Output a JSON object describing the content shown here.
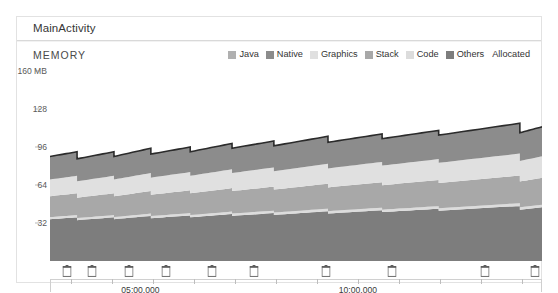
{
  "panel": {
    "header_title": "MainActivity",
    "section_label": "MEMORY"
  },
  "legend": {
    "items": [
      {
        "label": "Java",
        "color": "#b0b0b0",
        "swatch": true
      },
      {
        "label": "Native",
        "color": "#8c8c8c",
        "swatch": true
      },
      {
        "label": "Graphics",
        "color": "#e0e0e0",
        "swatch": true
      },
      {
        "label": "Stack",
        "color": "#a8a8a8",
        "swatch": true
      },
      {
        "label": "Code",
        "color": "#dcdcdc",
        "swatch": true
      },
      {
        "label": "Others",
        "color": "#7d7d7d",
        "swatch": true
      },
      {
        "label": "Allocated",
        "color": "#2b2b2b",
        "swatch": false
      }
    ]
  },
  "chart_data": {
    "type": "area",
    "title": "MEMORY",
    "xlabel": "",
    "ylabel": "MB",
    "ylim": [
      0,
      160
    ],
    "yticks": [
      32,
      64,
      96,
      128,
      160
    ],
    "ytick_labels": [
      "32",
      "64",
      "96",
      "128",
      "160 MB"
    ],
    "grid": false,
    "legend_position": "top-right",
    "x_axis": {
      "tick_count": 12,
      "labeled_ticks": [
        {
          "position": 0.145,
          "label": "05:00.000"
        },
        {
          "position": 0.587,
          "label": "10:00.000"
        }
      ]
    },
    "gc_events": {
      "icon": "trash-can-icon",
      "positions": [
        0.035,
        0.085,
        0.16,
        0.235,
        0.33,
        0.415,
        0.56,
        0.695,
        0.885,
        0.985
      ]
    },
    "series": [
      {
        "name": "Others",
        "color": "#7d7d7d",
        "stack_order": 1
      },
      {
        "name": "Code",
        "color": "#dcdcdc",
        "stack_order": 2
      },
      {
        "name": "Stack",
        "color": "#a8a8a8",
        "stack_order": 3
      },
      {
        "name": "Graphics",
        "color": "#e0e0e0",
        "stack_order": 4
      },
      {
        "name": "Native",
        "color": "#8c8c8c",
        "stack_order": 5
      },
      {
        "name": "Java",
        "color": "#b0b0b0",
        "stack_order": 6
      },
      {
        "name": "Allocated",
        "color": "#2b2b2b",
        "stack_order": 7,
        "render": "line"
      }
    ],
    "sawtooth_segments": [
      {
        "x0": 0.0,
        "x1": 0.055,
        "total_start": 88,
        "total_end": 92
      },
      {
        "x0": 0.055,
        "x1": 0.13,
        "total_start": 86,
        "total_end": 92
      },
      {
        "x0": 0.13,
        "x1": 0.205,
        "total_start": 88,
        "total_end": 95
      },
      {
        "x0": 0.205,
        "x1": 0.285,
        "total_start": 90,
        "total_end": 96
      },
      {
        "x0": 0.285,
        "x1": 0.37,
        "total_start": 92,
        "total_end": 99
      },
      {
        "x0": 0.37,
        "x1": 0.455,
        "total_start": 95,
        "total_end": 101
      },
      {
        "x0": 0.455,
        "x1": 0.565,
        "total_start": 97,
        "total_end": 105
      },
      {
        "x0": 0.565,
        "x1": 0.675,
        "total_start": 100,
        "total_end": 107
      },
      {
        "x0": 0.675,
        "x1": 0.79,
        "total_start": 103,
        "total_end": 110
      },
      {
        "x0": 0.79,
        "x1": 0.955,
        "total_start": 106,
        "total_end": 116
      },
      {
        "x0": 0.955,
        "x1": 1.0,
        "total_start": 108,
        "total_end": 113
      }
    ],
    "band_fractions": {
      "others": 0.0,
      "code": 0.4,
      "stack": 0.42,
      "graphics": 0.62,
      "native": 0.78,
      "java": 1.0
    }
  }
}
